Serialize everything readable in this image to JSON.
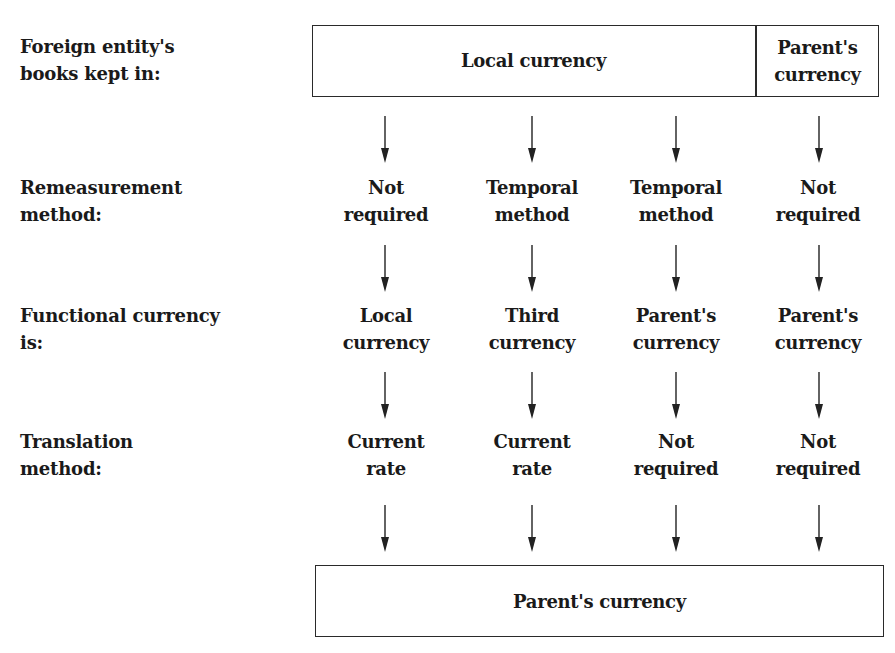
{
  "row_labels": {
    "books": [
      "Foreign entity's",
      "books kept in:"
    ],
    "remeasurement": [
      "Remeasurement",
      "method:"
    ],
    "functional": [
      "Functional currency",
      "is:"
    ],
    "translation": [
      "Translation",
      "method:"
    ]
  },
  "top_box": {
    "left_label": "Local currency",
    "right_label": [
      "Parent's",
      "currency"
    ]
  },
  "columns": [
    {
      "remeasurement": [
        "Not",
        "required"
      ],
      "functional": [
        "Local",
        "currency"
      ],
      "translation": [
        "Current",
        "rate"
      ]
    },
    {
      "remeasurement": [
        "Temporal",
        "method"
      ],
      "functional": [
        "Third",
        "currency"
      ],
      "translation": [
        "Current",
        "rate"
      ]
    },
    {
      "remeasurement": [
        "Temporal",
        "method"
      ],
      "functional": [
        "Parent's",
        "currency"
      ],
      "translation": [
        "Not",
        "required"
      ]
    },
    {
      "remeasurement": [
        "Not",
        "required"
      ],
      "functional": [
        "Parent's",
        "currency"
      ],
      "translation": [
        "Not",
        "required"
      ]
    }
  ],
  "bottom_box": {
    "label": "Parent's currency"
  }
}
